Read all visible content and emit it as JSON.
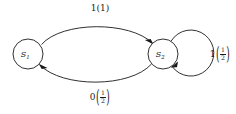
{
  "diagram": {
    "type": "markov-state-transition",
    "background_color": "#ffffff",
    "stroke_color": "#1a1a1a",
    "nodes": [
      {
        "id": "s1",
        "label_base": "S",
        "label_sub": "1",
        "cx": 28,
        "cy": 54,
        "r": 15
      },
      {
        "id": "s2",
        "label_base": "S",
        "label_sub": "2",
        "cx": 163,
        "cy": 54,
        "r": 15
      }
    ],
    "edges": [
      {
        "id": "s1-to-s2",
        "from": "s1",
        "to": "s2",
        "kind": "arc-upper",
        "label_symbol": "1",
        "label_prob_numerator": "1",
        "label_prob_denominator": "",
        "label_text": "1(1)"
      },
      {
        "id": "s2-to-s1",
        "from": "s2",
        "to": "s1",
        "kind": "arc-lower",
        "label_symbol": "0",
        "label_prob_numerator": "1",
        "label_prob_denominator": "2",
        "label_text": "0(1/2)"
      },
      {
        "id": "s2-self-loop",
        "from": "s2",
        "to": "s2",
        "kind": "self-loop",
        "label_symbol": "1",
        "label_prob_numerator": "1",
        "label_prob_denominator": "2",
        "label_text": "1(1/2)"
      }
    ],
    "labels": {
      "top": {
        "symbol": "1",
        "open_paren": "(",
        "close_paren": ")",
        "value": "1"
      },
      "bottom": {
        "symbol": "0",
        "open_paren": "(",
        "close_paren": ")",
        "numerator": "1",
        "denominator": "2"
      },
      "loop": {
        "symbol": "1",
        "open_paren": "(",
        "close_paren": ")",
        "numerator": "1",
        "denominator": "2"
      }
    }
  }
}
